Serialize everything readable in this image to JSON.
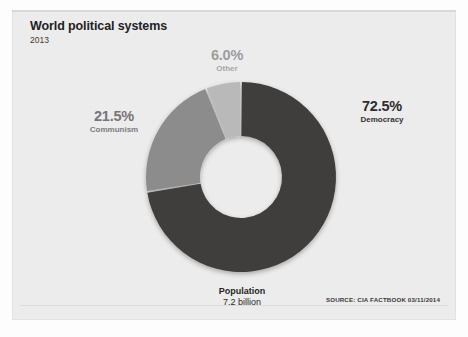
{
  "card": {
    "title": "World political systems",
    "year": "2013",
    "total_label": "Population",
    "total_value": "7.2 billion",
    "source": "SOURCE: CIA FACTBOOK 03/11/2014"
  },
  "chart_data": {
    "type": "pie",
    "variant": "donut",
    "title": "World political systems",
    "subtitle": "2013",
    "xlabel": "",
    "ylabel": "",
    "units": "percent of world population",
    "total_label": "Population",
    "total_value": "7.2 billion",
    "grid": false,
    "legend": "labels-outside-slices",
    "start_angle_deg": 0,
    "direction": "clockwise",
    "categories": [
      "Democracy",
      "Communism",
      "Other"
    ],
    "values": [
      72.5,
      21.5,
      6.0
    ],
    "value_labels": [
      "72.5%",
      "21.5%",
      "6.0%"
    ],
    "colors": [
      "#3f3e3d",
      "#8c8c8c",
      "#b9b9b9"
    ],
    "slices": [
      {
        "name": "Democracy",
        "value": 72.5,
        "label": "72.5%",
        "color": "#3f3e3d",
        "start_deg": 0,
        "sweep_deg": 261.0
      },
      {
        "name": "Communism",
        "value": 21.5,
        "label": "21.5%",
        "color": "#8c8c8c",
        "start_deg": 261.0,
        "sweep_deg": 77.4
      },
      {
        "name": "Other",
        "value": 6.0,
        "label": "6.0%",
        "color": "#b9b9b9",
        "start_deg": 338.4,
        "sweep_deg": 21.6
      }
    ],
    "annotations": [
      "SOURCE: CIA FACTBOOK 03/11/2014"
    ]
  }
}
